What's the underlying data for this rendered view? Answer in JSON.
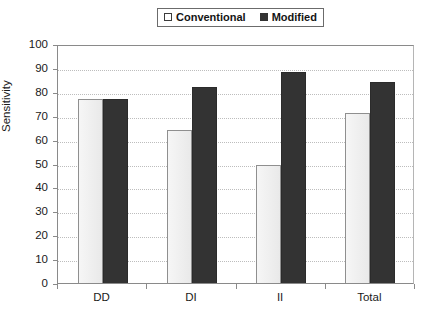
{
  "legend": {
    "position": "top-center",
    "boxed": true,
    "entries": [
      {
        "label": "Conventional",
        "swatch": "empty-square-icon",
        "color": "#ffffff"
      },
      {
        "label": "Modified",
        "swatch": "filled-square-icon",
        "color": "#333333"
      }
    ]
  },
  "axis": {
    "ylabel": "Sensitivity",
    "yticks": [
      "0",
      "10",
      "20",
      "30",
      "40",
      "50",
      "60",
      "70",
      "80",
      "90",
      "100"
    ],
    "xticks": [
      "DD",
      "DI",
      "II",
      "Total"
    ]
  },
  "chart_data": {
    "type": "bar",
    "title": "",
    "xlabel": "",
    "ylabel": "Sensitivity",
    "categories": [
      "DD",
      "DI",
      "II",
      "Total"
    ],
    "series": [
      {
        "name": "Conventional",
        "color": "#eeeeee",
        "values": [
          77,
          64,
          49.5,
          71
        ]
      },
      {
        "name": "Modified",
        "color": "#333333",
        "values": [
          77,
          82,
          88.5,
          84
        ]
      }
    ],
    "ylim": [
      0,
      100
    ],
    "ytick_step": 10,
    "grid": true,
    "grid_style": "dotted-horizontal",
    "legend_position": "top-center"
  }
}
